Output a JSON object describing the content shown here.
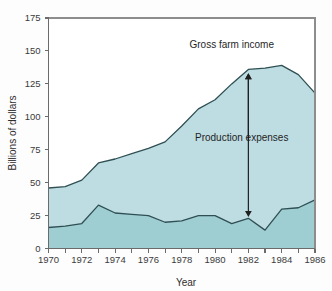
{
  "chart_data": {
    "type": "area",
    "title": "",
    "xlabel": "Year",
    "ylabel": "Billions of dollars",
    "xlim": [
      1970,
      1986
    ],
    "ylim": [
      0,
      175
    ],
    "grid": false,
    "legend_position": "inline-annotations",
    "x": [
      1970,
      1971,
      1972,
      1973,
      1974,
      1975,
      1976,
      1977,
      1978,
      1979,
      1980,
      1981,
      1982,
      1983,
      1984,
      1985,
      1986
    ],
    "y_ticks": [
      0,
      25,
      50,
      75,
      100,
      125,
      150,
      175
    ],
    "y_tick_labels": [
      "0",
      "25",
      "50",
      "75",
      "100",
      "125",
      "150",
      "175"
    ],
    "x_ticks": [
      1970,
      1971,
      1972,
      1973,
      1974,
      1975,
      1976,
      1977,
      1978,
      1979,
      1980,
      1981,
      1982,
      1983,
      1984,
      1985,
      1986
    ],
    "x_tick_labels_shown": [
      "1970",
      "1972",
      "1974",
      "1976",
      "1978",
      "1980",
      "1982",
      "1984",
      "1986"
    ],
    "series": [
      {
        "name": "Gross farm income",
        "color": "#bedde3",
        "line_color": "#2f4f53",
        "values": [
          46,
          47,
          52,
          65,
          68,
          72,
          76,
          81,
          93,
          106,
          113,
          125,
          136,
          137,
          139,
          132,
          118
        ]
      },
      {
        "name": "Net farm income",
        "color": "#9ecdd2",
        "line_color": "#2f4f53",
        "values": [
          16,
          17,
          19,
          33,
          27,
          26,
          25,
          20,
          21,
          25,
          25,
          19,
          23,
          14,
          30,
          31,
          37
        ]
      }
    ],
    "annotations": [
      {
        "id": "gross-farm-income",
        "text": "Gross farm income",
        "label_x": 1981.0,
        "label_y": 152,
        "arrow_from_year": 1982,
        "arrow_from_value": 82,
        "arrow_to_value": 133
      },
      {
        "id": "production-expenses",
        "text": "Production expenses",
        "label_x": 1981.6,
        "label_y": 82,
        "arrow_year": 1982,
        "arrow_top_value": 133,
        "arrow_bottom_value": 24
      }
    ]
  },
  "axis": {
    "y_title": "Billions of dollars",
    "x_title": "Year"
  }
}
